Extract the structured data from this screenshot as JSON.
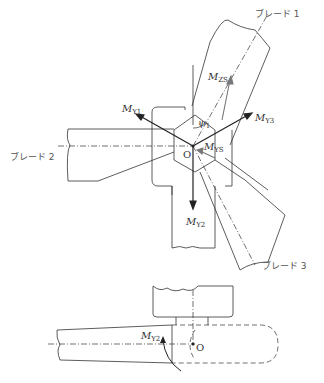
{
  "labels": {
    "blade1": "ブレード 1",
    "blade2": "ブレード 2",
    "blade3": "ブレード 3",
    "origin": "O",
    "origin_bottom": "O",
    "psi": "ψ",
    "psi_sub": "1",
    "my1": "M",
    "my1_sub": "Y1",
    "my2": "M",
    "my2_sub": "Y2",
    "my3": "M",
    "my3_sub": "Y3",
    "mys": "M",
    "mys_sub": "YS",
    "mzs": "M",
    "mzs_sub": "ZS",
    "my2_bottom": "M",
    "my2_bottom_sub": "Y2"
  },
  "colors": {
    "line": "#333333",
    "arrow": "#222222",
    "gray_arrow": "#777777"
  }
}
